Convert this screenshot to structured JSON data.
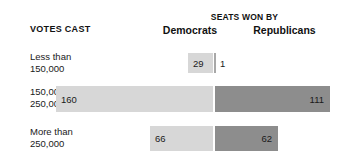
{
  "header": {
    "group_label": "SEATS WON BY",
    "left_category_label": "VOTES CAST",
    "columns": [
      {
        "label": "Democrats"
      },
      {
        "label": "Republicans"
      }
    ]
  },
  "rows": [
    {
      "label_line1": "Less than",
      "label_line2": "150,000",
      "dem_value": "29",
      "rep_value": "1"
    },
    {
      "label_line1": "150,000–",
      "label_line2": "250,000",
      "dem_value": "160",
      "rep_value": "111"
    },
    {
      "label_line1": "More than",
      "label_line2": "250,000",
      "dem_value": "66",
      "rep_value": "62"
    }
  ],
  "colors": {
    "democrat_bar": "#d7d7d7",
    "republican_bar": "#8d8d8d",
    "background": "#ffffff",
    "text": "#1a1a1a"
  },
  "chart_data": {
    "type": "bar",
    "title": "SEATS WON BY",
    "subtitle": "",
    "xlabel": "",
    "ylabel": "VOTES CAST",
    "orientation": "horizontal-diverging",
    "categories": [
      "Less than 150,000",
      "150,000–250,000",
      "More than 250,000"
    ],
    "series": [
      {
        "name": "Democrats",
        "values": [
          29,
          160,
          66
        ],
        "color": "#d7d7d7",
        "direction": "left"
      },
      {
        "name": "Republicans",
        "values": [
          1,
          111,
          62
        ],
        "color": "#8d8d8d",
        "direction": "right"
      }
    ],
    "data_labels": true,
    "grid": false,
    "legend": "top-column-headers",
    "axis_center_px": 214,
    "xlim": [
      0,
      160
    ]
  }
}
